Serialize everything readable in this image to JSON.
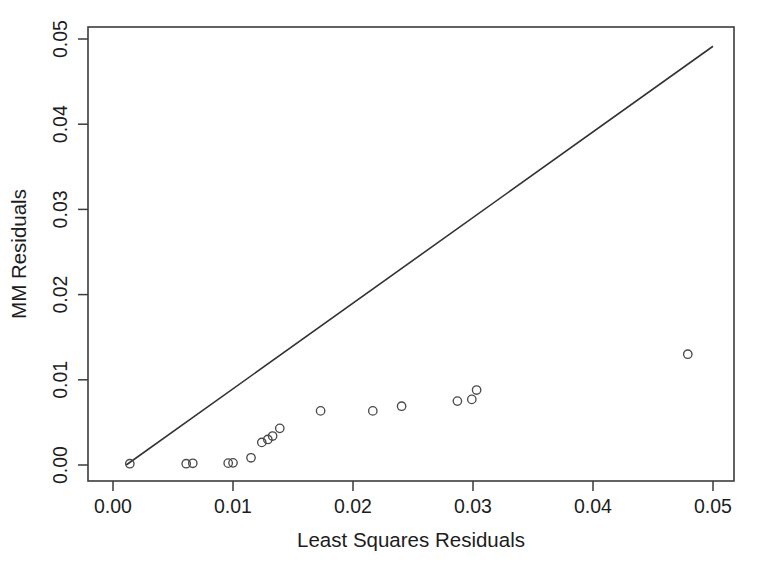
{
  "chart_data": {
    "type": "scatter",
    "title": "",
    "subtitle": "",
    "xlabel": "Least Squares Residuals",
    "ylabel": "MM Residuals",
    "xlim": [
      -0.002,
      0.0518
    ],
    "ylim": [
      -0.0018,
      0.052
    ],
    "xticks": [
      0.0,
      0.01,
      0.02,
      0.03,
      0.04,
      0.05
    ],
    "yticks": [
      0.0,
      0.01,
      0.02,
      0.03,
      0.04,
      0.05
    ],
    "xticklabels": [
      "0.00",
      "0.01",
      "0.02",
      "0.03",
      "0.04",
      "0.05"
    ],
    "yticklabels": [
      "0.00",
      "0.01",
      "0.02",
      "0.03",
      "0.04",
      "0.05"
    ],
    "grid": false,
    "legend": false,
    "legend_position": "none",
    "marker": "open-circle",
    "marker_size_px": 4.2,
    "point_color": "#4a4a4a",
    "line_color": "#333333",
    "frame_color": "#3b3b3b",
    "background": "#ffffff",
    "series": [
      {
        "name": "Residual pairs",
        "points": [
          {
            "x": 0.0014,
            "y": 0.00015
          },
          {
            "x": 0.0061,
            "y": 0.00015
          },
          {
            "x": 0.00665,
            "y": 0.0002
          },
          {
            "x": 0.0096,
            "y": 0.00022
          },
          {
            "x": 0.01,
            "y": 0.00025
          },
          {
            "x": 0.0115,
            "y": 0.00085
          },
          {
            "x": 0.0124,
            "y": 0.00265
          },
          {
            "x": 0.0129,
            "y": 0.003
          },
          {
            "x": 0.0133,
            "y": 0.0034
          },
          {
            "x": 0.0139,
            "y": 0.0043
          },
          {
            "x": 0.0173,
            "y": 0.00635
          },
          {
            "x": 0.02165,
            "y": 0.00635
          },
          {
            "x": 0.02405,
            "y": 0.0069
          },
          {
            "x": 0.0287,
            "y": 0.0075
          },
          {
            "x": 0.0299,
            "y": 0.0077
          },
          {
            "x": 0.0303,
            "y": 0.0088
          },
          {
            "x": 0.0479,
            "y": 0.013
          }
        ]
      }
    ],
    "reference_line": {
      "name": "y = x identity line",
      "x0": 0.0011,
      "y0": 0.0,
      "x1": 0.05,
      "y1": 0.04915
    }
  },
  "axes": {
    "x_title": "Least Squares Residuals",
    "y_title": "MM Residuals"
  }
}
